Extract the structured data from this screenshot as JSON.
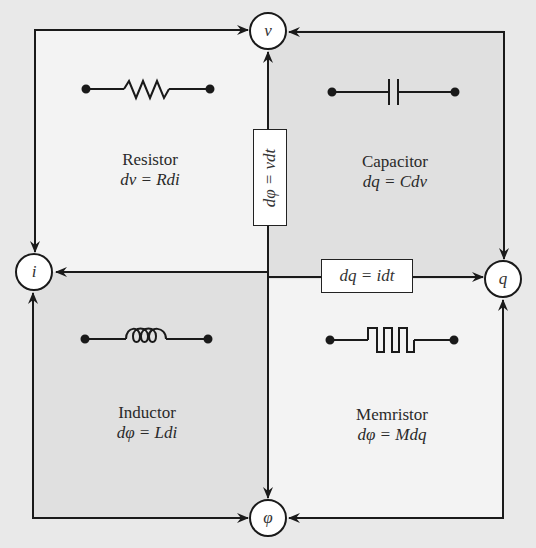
{
  "nodes": {
    "v": "v",
    "i": "i",
    "q": "q",
    "phi": "φ"
  },
  "quadrants": {
    "resistor": {
      "name": "Resistor",
      "equation": "dv = Rdi",
      "symbol": "resistor-zigzag"
    },
    "capacitor": {
      "name": "Capacitor",
      "equation": "dq = Cdv",
      "symbol": "capacitor-plates"
    },
    "inductor": {
      "name": "Inductor",
      "equation": "dφ = Ldi",
      "symbol": "inductor-coil"
    },
    "memristor": {
      "name": "Memristor",
      "equation": "dφ = Mdq",
      "symbol": "memristor-square-wave"
    }
  },
  "relations": {
    "vertical": "dφ = vdt",
    "horizontal": "dq = idt"
  },
  "colors": {
    "light_quadrant": "#f3f3f3",
    "dark_quadrant": "#e2e2e2",
    "line": "#1a1a1a"
  }
}
